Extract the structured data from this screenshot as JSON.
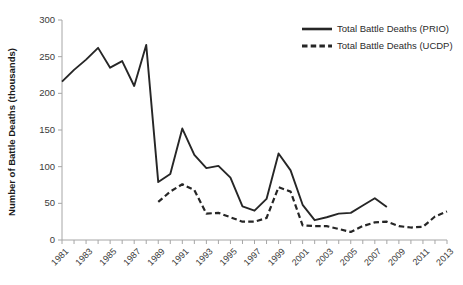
{
  "chart_data": {
    "type": "line",
    "title": "",
    "subtitle": "",
    "xlabel": "",
    "ylabel": "Number of Battle Deaths (thousands)",
    "ylim": [
      0,
      300
    ],
    "yticks": [
      0,
      50,
      100,
      150,
      200,
      250,
      300
    ],
    "ytick_labels": [
      "0",
      "50",
      "100",
      "150",
      "200",
      "250",
      "300"
    ],
    "xlim": [
      1981,
      2013
    ],
    "x": [
      1981,
      1982,
      1983,
      1984,
      1985,
      1986,
      1987,
      1988,
      1989,
      1990,
      1991,
      1992,
      1993,
      1994,
      1995,
      1996,
      1997,
      1998,
      1999,
      2000,
      2001,
      2002,
      2003,
      2004,
      2005,
      2006,
      2007,
      2008,
      2009,
      2010,
      2011,
      2012,
      2013
    ],
    "xticks": [
      1981,
      1983,
      1985,
      1987,
      1989,
      1991,
      1993,
      1995,
      1997,
      1999,
      2001,
      2003,
      2005,
      2007,
      2009,
      2011,
      2013
    ],
    "xtick_labels": [
      "1981",
      "1983",
      "1985",
      "1987",
      "1989",
      "1991",
      "1993",
      "1995",
      "1997",
      "1999",
      "2001",
      "2003",
      "2005",
      "2007",
      "2009",
      "2011",
      "2013"
    ],
    "grid": false,
    "legend_position": "top-right",
    "series": [
      {
        "name": "Total Battle Deaths (PRIO)",
        "style": "solid",
        "color": "#262626",
        "x": [
          1981,
          1982,
          1983,
          1984,
          1985,
          1986,
          1987,
          1988,
          1989,
          1990,
          1991,
          1992,
          1993,
          1994,
          1995,
          1996,
          1997,
          1998,
          1999,
          2000,
          2001,
          2002,
          2003,
          2004,
          2005,
          2006,
          2007,
          2008
        ],
        "values": [
          216,
          232,
          246,
          262,
          235,
          244,
          210,
          266,
          79,
          90,
          152,
          116,
          98,
          101,
          85,
          46,
          40,
          56,
          118,
          95,
          48,
          27,
          31,
          36,
          37,
          47,
          57,
          45
        ]
      },
      {
        "name": "Total Battle Deaths (UCDP)",
        "style": "dashed",
        "color": "#262626",
        "x": [
          1989,
          1990,
          1991,
          1992,
          1993,
          1994,
          1995,
          1996,
          1997,
          1998,
          1999,
          2000,
          2001,
          2002,
          2003,
          2004,
          2005,
          2006,
          2007,
          2008,
          2009,
          2010,
          2011,
          2012,
          2013
        ],
        "values": [
          52,
          66,
          76,
          68,
          36,
          37,
          31,
          25,
          25,
          30,
          72,
          66,
          20,
          19,
          19,
          15,
          11,
          19,
          24,
          25,
          19,
          17,
          18,
          32,
          39
        ]
      }
    ]
  },
  "legend": {
    "items": [
      {
        "label": "Total Battle Deaths (PRIO)",
        "style": "solid"
      },
      {
        "label": "Total Battle Deaths (UCDP)",
        "style": "dashed"
      }
    ]
  },
  "axis": {
    "y_title": "Number of Battle Deaths (thousands)"
  }
}
